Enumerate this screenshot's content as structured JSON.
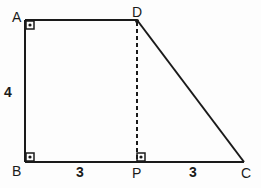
{
  "figure": {
    "type": "geometry-trapezoid",
    "vertices": [
      {
        "label": "A",
        "x": 25,
        "y": 20
      },
      {
        "label": "D",
        "x": 137,
        "y": 20
      },
      {
        "label": "C",
        "x": 244,
        "y": 162
      },
      {
        "label": "B",
        "x": 25,
        "y": 162
      }
    ],
    "foot_point": {
      "label": "P",
      "x": 137,
      "y": 162
    },
    "segments": [
      {
        "from": "A",
        "to": "D",
        "style": "solid"
      },
      {
        "from": "D",
        "to": "C",
        "style": "solid"
      },
      {
        "from": "C",
        "to": "B",
        "style": "solid"
      },
      {
        "from": "B",
        "to": "A",
        "style": "solid"
      },
      {
        "from": "D",
        "to": "P",
        "style": "dashed"
      }
    ],
    "right_angles": [
      "A",
      "B",
      "P"
    ],
    "measurements": [
      {
        "segment": "AB",
        "value": "4"
      },
      {
        "segment": "BP",
        "value": "3"
      },
      {
        "segment": "PC",
        "value": "3"
      }
    ],
    "colors": {
      "stroke": "#1a1a1a",
      "background": "#fdfdfd"
    }
  },
  "labels": {
    "A": "A",
    "B": "B",
    "C": "C",
    "D": "D",
    "P": "P",
    "AB": "4",
    "BP": "3",
    "PC": "3"
  }
}
